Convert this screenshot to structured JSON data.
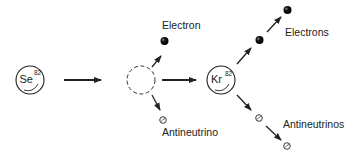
{
  "diagram": {
    "nodes": {
      "parent": {
        "symbol": "Se",
        "mass_number": "82"
      },
      "intermediate": {
        "style": "dashed-circle"
      },
      "daughter": {
        "symbol": "Kr",
        "mass_number": "82"
      }
    },
    "labels": {
      "electron_single": "Electron",
      "antineutrino_single": "Antineutrino",
      "electron_plural": "Electrons",
      "antineutrino_plural": "Antineutrinos"
    },
    "colors": {
      "stroke": "#222222",
      "electron_fill": "#111111",
      "background": "#ffffff"
    }
  }
}
